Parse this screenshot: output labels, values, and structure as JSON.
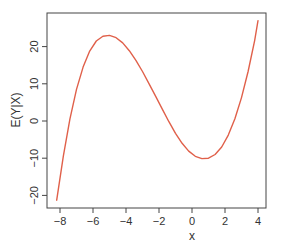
{
  "chart_data": {
    "type": "line",
    "title": "",
    "xlabel": "x",
    "ylabel": "E(Y|X)",
    "xlim": [
      -8.4,
      4.4
    ],
    "ylim": [
      -23.5,
      29.5
    ],
    "grid": false,
    "legend": null,
    "x_ticks": [
      -8,
      -6,
      -4,
      -2,
      0,
      2,
      4
    ],
    "x_tick_labels": [
      "−8",
      "−6",
      "−4",
      "−2",
      "0",
      "2",
      "4"
    ],
    "y_ticks": [
      -20,
      -10,
      0,
      10,
      20
    ],
    "y_tick_labels": [
      "−20",
      "−10",
      "0",
      "10",
      "20"
    ],
    "series": [
      {
        "name": "E(Y|X)",
        "color": "#e0604a",
        "x": [
          -8.2,
          -7.8,
          -7.4,
          -7.0,
          -6.6,
          -6.2,
          -5.8,
          -5.4,
          -5.0,
          -4.6,
          -4.2,
          -3.8,
          -3.4,
          -3.0,
          -2.6,
          -2.2,
          -1.8,
          -1.4,
          -1.0,
          -0.6,
          -0.2,
          0.2,
          0.6,
          1.0,
          1.4,
          1.8,
          2.2,
          2.6,
          3.0,
          3.4,
          3.8,
          4.0
        ],
        "y": [
          -21.3,
          -9.5,
          0.5,
          8.5,
          14.5,
          18.8,
          21.5,
          22.8,
          23.0,
          22.4,
          21.0,
          18.9,
          16.3,
          13.3,
          10.0,
          6.6,
          3.2,
          -0.2,
          -3.3,
          -6.0,
          -8.1,
          -9.5,
          -10.1,
          -10.0,
          -9.0,
          -7.0,
          -3.8,
          0.6,
          6.3,
          13.3,
          21.7,
          27.0
        ]
      }
    ]
  }
}
